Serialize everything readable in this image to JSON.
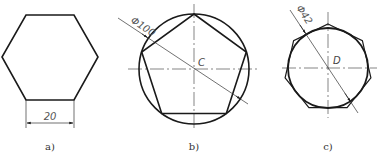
{
  "figures": [
    {
      "id": "a",
      "caption": "a)",
      "shape": "regular-hexagon",
      "dimension_label": "20"
    },
    {
      "id": "b",
      "caption": "b)",
      "shape": "regular-pentagon-inscribed-in-circle",
      "diameter_label": "Φ100",
      "center_label": "C"
    },
    {
      "id": "c",
      "caption": "c)",
      "shape": "regular-heptagon-circumscribed-about-circle",
      "diameter_label": "Φ42",
      "center_label": "D"
    }
  ],
  "colors": {
    "stroke": "#1a1a1a",
    "thin": "#333333",
    "background": "#ffffff"
  }
}
